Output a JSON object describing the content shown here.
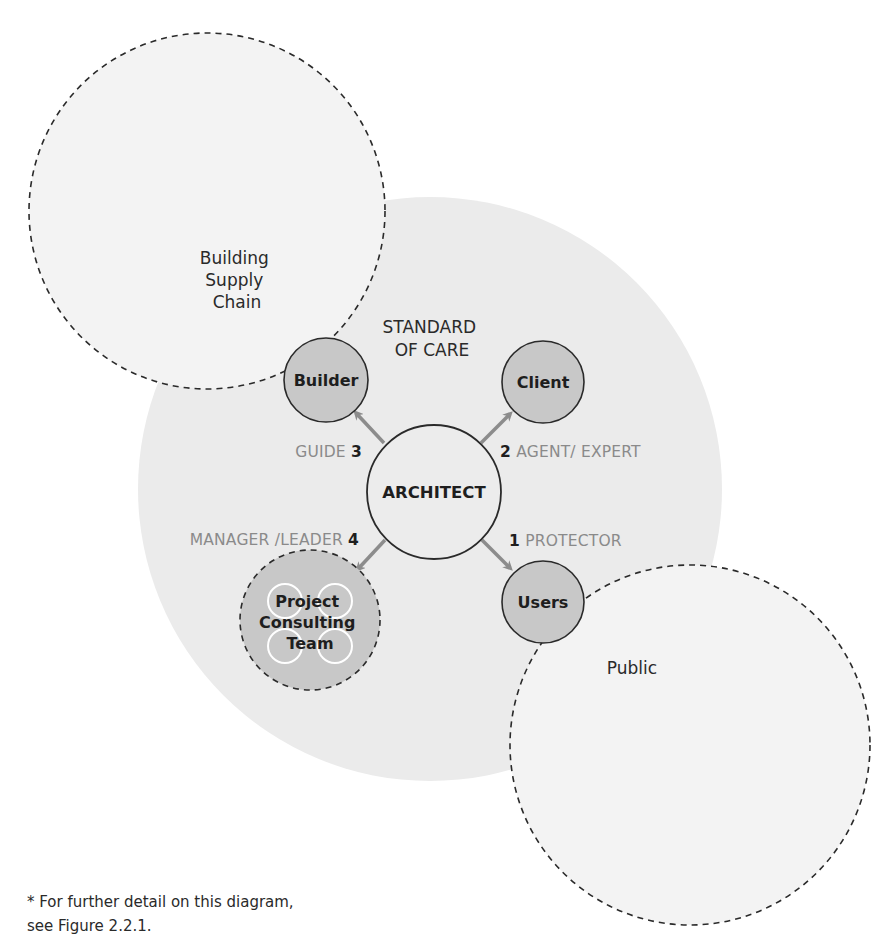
{
  "colors": {
    "outer_region_fill": "#f3f3f3",
    "standard_of_care_fill": "#ebebeb",
    "node_fill": "#c8c8c8",
    "architect_fill": "#ececec",
    "stroke": "#2a2a2a",
    "arrow": "#8c8c8c",
    "role_text": "#8a8a8a"
  },
  "regions": {
    "supply_chain": {
      "line1": "Building",
      "line2": "Supply",
      "line3": "Chain"
    },
    "standard_of_care": {
      "line1": "STANDARD",
      "line2": "OF CARE"
    },
    "public": {
      "label": "Public"
    }
  },
  "center": {
    "label": "ARCHITECT"
  },
  "nodes": {
    "builder": {
      "label": "Builder"
    },
    "client": {
      "label": "Client"
    },
    "users": {
      "label": "Users"
    },
    "team": {
      "line1": "Project",
      "line2": "Consulting",
      "line3": "Team"
    }
  },
  "roles": {
    "protector": {
      "number": "1",
      "label": "PROTECTOR"
    },
    "agent": {
      "number": "2",
      "label": "AGENT/ EXPERT"
    },
    "guide": {
      "number": "3",
      "label": "GUIDE"
    },
    "manager": {
      "number": "4",
      "label": "MANAGER /LEADER"
    }
  },
  "footnote": {
    "line1": "* For further detail on this diagram,",
    "line2": "see Figure 2.2.1."
  }
}
